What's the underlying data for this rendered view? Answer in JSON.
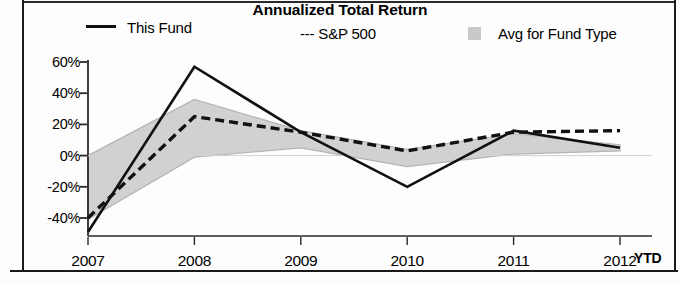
{
  "chart_data": {
    "type": "line",
    "title": "Annualized Total Return",
    "xlabel": "",
    "ylabel": "",
    "x": [
      "2007",
      "2008",
      "2009",
      "2010",
      "2011",
      "2012"
    ],
    "x_suffix_label": "YTD",
    "ylim": [
      -50,
      60
    ],
    "yticks": [
      60,
      40,
      20,
      0,
      -20,
      -40
    ],
    "ytick_labels": [
      "60%",
      "40%",
      "20%",
      "0%",
      "-20%",
      "-40%"
    ],
    "grid": false,
    "legend_position": "top",
    "series": [
      {
        "name": "This Fund",
        "style": "solid",
        "color": "#111111",
        "values": [
          -49,
          57,
          15,
          -20,
          16,
          5
        ]
      },
      {
        "name": "S&P 500",
        "style": "dashed",
        "color": "#111111",
        "values": [
          -40,
          25,
          15,
          3,
          15,
          16
        ]
      },
      {
        "name": "Avg for Fund Type",
        "style": "shaded-band",
        "color": "#cfcfcf",
        "upper": [
          0,
          36,
          16,
          4,
          14,
          7
        ],
        "lower": [
          -41,
          -1,
          5,
          -7,
          1,
          3
        ]
      }
    ]
  },
  "legend": {
    "items": [
      {
        "label": "This Fund",
        "marker": "solid-line-swatch"
      },
      {
        "label": "--- S&P 500",
        "marker": "dashed-line-swatch"
      },
      {
        "label": "Avg for Fund Type",
        "marker": "gray-box-swatch"
      }
    ]
  },
  "axes": {
    "y_tick_labels": [
      "60%",
      "40%",
      "20%",
      "0%",
      "-20%",
      "-40%"
    ],
    "x_tick_labels": [
      "2007",
      "2008",
      "2009",
      "2010",
      "2011",
      "2012"
    ],
    "x_trailing_label": "YTD"
  },
  "colors": {
    "line": "#111111",
    "band": "#cfcfcf",
    "axis": "#2a2a2a",
    "background": "#fdfdfd"
  }
}
